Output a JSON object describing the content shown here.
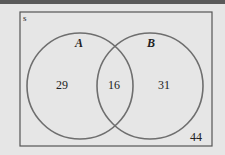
{
  "diagram": {
    "type": "venn",
    "universe_label": "s",
    "sets": [
      {
        "name": "A",
        "only_count": "29"
      },
      {
        "name": "B",
        "only_count": "31"
      }
    ],
    "intersection_count": "16",
    "outside_count": "44"
  },
  "colors": {
    "background": "#e6e6e6",
    "circle_stroke": "#6e6e6e",
    "rect_stroke": "#555555",
    "text": "#222222"
  }
}
